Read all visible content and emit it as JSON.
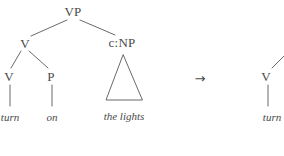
{
  "figure": {
    "type": "syntax-tree-transformation",
    "line_color": "#585858",
    "text_color": "#4a4a4a",
    "background": "#ffffff",
    "operator": {
      "symbol": "→",
      "name": "rightwards-arrow",
      "x": 200,
      "y": 78
    },
    "left_tree": {
      "nodes": [
        {
          "id": "vp",
          "label": "VP",
          "x": 73,
          "y": 11
        },
        {
          "id": "v1",
          "label": "V",
          "x": 25,
          "y": 43
        },
        {
          "id": "cnp",
          "label": "c:NP",
          "x": 122,
          "y": 42
        },
        {
          "id": "v2",
          "label": "V",
          "x": 9,
          "y": 76
        },
        {
          "id": "p",
          "label": "P",
          "x": 51,
          "y": 76
        }
      ],
      "terminals": [
        {
          "id": "turn",
          "label": "turn",
          "x": 10,
          "y": 117
        },
        {
          "id": "on",
          "label": "on",
          "x": 52,
          "y": 117
        },
        {
          "id": "the-lights",
          "label": "the lights",
          "x": 124,
          "y": 116
        }
      ],
      "triangle": {
        "id": "np-triangle",
        "apex_x": 123,
        "apex_y": 55,
        "left_x": 106,
        "right_x": 142,
        "base_y": 100
      }
    },
    "right_tree": {
      "clipped": true,
      "nodes": [
        {
          "id": "v-right",
          "label": "V",
          "x": 266,
          "y": 76
        }
      ],
      "terminals": [
        {
          "id": "turn-right",
          "label": "turn",
          "x": 272,
          "y": 117
        }
      ]
    }
  }
}
